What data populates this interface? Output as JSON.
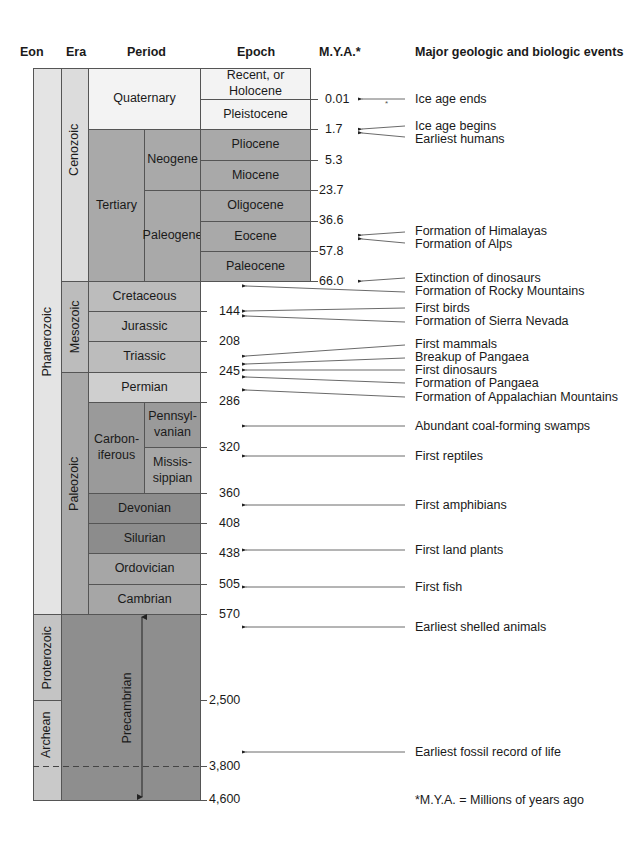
{
  "headers": {
    "eon": "Eon",
    "era": "Era",
    "period": "Period",
    "epoch": "Epoch",
    "mya": "M.Y.A.*",
    "events": "Major geologic and biologic events"
  },
  "eons": [
    {
      "name": "Phanerozoic"
    },
    {
      "name": "Proterozoic"
    },
    {
      "name": "Archean"
    }
  ],
  "eras": [
    {
      "name": "Cenozoic"
    },
    {
      "name": "Mesozoic"
    },
    {
      "name": "Paleozoic"
    }
  ],
  "periods": {
    "quaternary": "Quaternary",
    "tertiary": "Tertiary",
    "neogene": "Neogene",
    "paleogene": "Paleogene",
    "cretaceous": "Cretaceous",
    "jurassic": "Jurassic",
    "triassic": "Triassic",
    "permian": "Permian",
    "carboniferous": "Carbon-\niferous",
    "pennsylvanian": "Pennsyl-\nvanian",
    "mississippian": "Missis-\nsippian",
    "devonian": "Devonian",
    "silurian": "Silurian",
    "ordovician": "Ordovician",
    "cambrian": "Cambrian",
    "precambrian": "Precambrian"
  },
  "epochs": [
    "Recent, or Holocene",
    "Pleistocene",
    "Pliocene",
    "Miocene",
    "Oligocene",
    "Eocene",
    "Paleocene"
  ],
  "mya": [
    "0.01",
    "1.7",
    "5.3",
    "23.7",
    "36.6",
    "57.8",
    "66.0",
    "144",
    "208",
    "245",
    "286",
    "320",
    "360",
    "408",
    "438",
    "505",
    "570",
    "2,500",
    "3,800",
    "4,600"
  ],
  "events": [
    "Ice age ends",
    "Ice age begins",
    "Earliest humans",
    "Formation of Himalayas",
    "Formation of Alps",
    "Extinction of dinosaurs",
    "Formation of Rocky Mountains",
    "First birds",
    "Formation of Sierra Nevada",
    "First mammals",
    "Breakup of Pangaea",
    "First dinosaurs",
    "Formation of Pangaea",
    "Formation of Appalachian Mountains",
    "Abundant coal-forming swamps",
    "First reptiles",
    "First amphibians",
    "First land plants",
    "First fish",
    "Earliest shelled animals",
    "Earliest fossil record of life"
  ],
  "footnote": "*M.Y.A. = Millions of years ago",
  "colors": {
    "eon_light": "#e4e4e4",
    "quaternary": "#f3f3f3",
    "cenozoic_era": "#dcdcdc",
    "tertiary": "#a9a9a9",
    "mesozoic": "#bcbcbc",
    "permian": "#cfcfcf",
    "paleozoic_era": "#a8a8a8",
    "carboniferous": "#9a9a9a",
    "devonian": "#8c8c8c",
    "ordovician": "#a6a6a6",
    "precambrian": "#8e8e8e",
    "proterozoic": "#c4c4c4"
  }
}
